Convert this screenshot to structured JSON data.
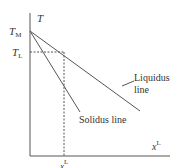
{
  "diagram": {
    "y_axis_label": "T",
    "x_axis_label": "x",
    "x_axis_label_sup": "L",
    "tick_x_label": "x",
    "tick_x_label_sup": "L",
    "tm_label": "T",
    "tm_sub": "M",
    "tl_label": "T",
    "tl_sub": "L",
    "liquidus_label_line1": "Liquidus",
    "liquidus_label_line2": "line",
    "solidus_label": "Solidus line",
    "colors": {
      "axis": "#555555",
      "line": "#555555",
      "dashed": "#555555",
      "text": "#333333"
    }
  }
}
